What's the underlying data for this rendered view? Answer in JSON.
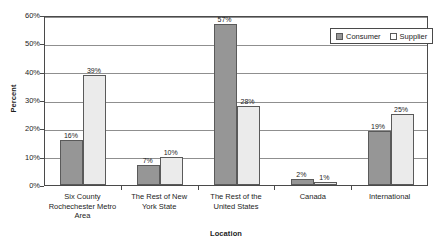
{
  "chart_data": {
    "type": "bar",
    "title": "",
    "xlabel": "Location",
    "ylabel": "Percent",
    "categories": [
      "Six County\nRochechester Metro\nArea",
      "The Rest of New\nYork State",
      "The Rest of the\nUnited States",
      "Canada",
      "International"
    ],
    "series": [
      {
        "name": "Consumer",
        "values": [
          16,
          7,
          57,
          2,
          19
        ],
        "color": "#969696"
      },
      {
        "name": "Supplier",
        "values": [
          39,
          10,
          28,
          1,
          25
        ],
        "color": "#ebebeb"
      }
    ],
    "value_labels": [
      [
        "16%",
        "39%"
      ],
      [
        "7%",
        "10%"
      ],
      [
        "57%",
        "28%"
      ],
      [
        "2%",
        "1%"
      ],
      [
        "19%",
        "25%"
      ]
    ],
    "ylim": [
      0,
      60
    ],
    "y_ticks": [
      0,
      10,
      20,
      30,
      40,
      50,
      60
    ],
    "y_tick_labels": [
      "0%",
      "10%",
      "20%",
      "30%",
      "40%",
      "50%",
      "60%"
    ],
    "grid": true,
    "legend_position": "top-right"
  },
  "legend": {
    "entries": [
      {
        "label": "Consumer",
        "swatch": "consumer"
      },
      {
        "label": "Supplier",
        "swatch": "supplier"
      }
    ]
  }
}
